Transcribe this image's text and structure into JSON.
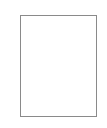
{
  "canvas": {
    "background_color": "#ffffff",
    "width": 107,
    "height": 128
  },
  "document_page": {
    "name": "blank-page",
    "border_color": "#8a8a8a",
    "fill_color": "#ffffff",
    "border_width_px": 1,
    "left_px": 20,
    "top_px": 15,
    "width_px": 77,
    "height_px": 102,
    "content_text": ""
  }
}
